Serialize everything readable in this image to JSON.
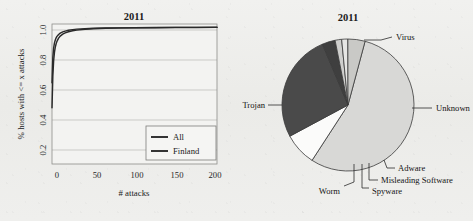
{
  "figure": {
    "background_color": "#eeeeec",
    "panels": [
      "line-chart",
      "pie-chart"
    ]
  },
  "chart_data": [
    {
      "type": "line",
      "title": "2011",
      "xlabel": "# attacks",
      "ylabel": "% hosts with <= x attacks",
      "xlim": [
        0,
        200
      ],
      "ylim": [
        0.15,
        1.02
      ],
      "xticks": [
        "0",
        "50",
        "100",
        "150",
        "200"
      ],
      "xtick_values": [
        0,
        50,
        100,
        150,
        200
      ],
      "yticks": [
        "0.2",
        "0.4",
        "0.6",
        "0.8",
        "1.0"
      ],
      "ytick_values": [
        0.2,
        0.4,
        0.6,
        0.8,
        1.0
      ],
      "grid": "horizontal",
      "legend_position": "lower right",
      "series": [
        {
          "name": "All",
          "color": "#2a2a2a",
          "x": [
            0,
            1,
            2,
            3,
            4,
            5,
            6,
            8,
            10,
            13,
            16,
            20,
            25,
            30,
            40,
            50,
            65,
            80,
            100,
            125,
            150,
            175,
            200
          ],
          "values": [
            0.5,
            0.695,
            0.793,
            0.845,
            0.876,
            0.897,
            0.912,
            0.932,
            0.945,
            0.957,
            0.965,
            0.972,
            0.978,
            0.982,
            0.987,
            0.99,
            0.993,
            0.995,
            0.996,
            0.997,
            0.998,
            0.998,
            0.999
          ]
        },
        {
          "name": "Finland",
          "color": "#2a2a2a",
          "x": [
            0,
            1,
            2,
            3,
            4,
            5,
            6,
            8,
            10,
            13,
            16,
            20,
            25,
            30,
            40,
            50,
            65,
            80,
            100,
            125,
            150,
            175,
            200
          ],
          "values": [
            0.655,
            0.812,
            0.872,
            0.903,
            0.921,
            0.934,
            0.943,
            0.955,
            0.963,
            0.971,
            0.976,
            0.981,
            0.985,
            0.988,
            0.991,
            0.993,
            0.995,
            0.996,
            0.997,
            0.998,
            0.999,
            0.999,
            1.0
          ]
        }
      ]
    },
    {
      "type": "pie",
      "title": "2011",
      "labels": [
        "Trojan",
        "Virus",
        "Unknown",
        "Adware",
        "Misleading Software",
        "Spyware",
        "Worm"
      ],
      "values": [
        55.0,
        8.0,
        26.5,
        3.2,
        1.6,
        1.5,
        4.2
      ],
      "colors": [
        "#d8d8d6",
        "#fbfbfa",
        "#4a4a4a",
        "#3f3f3f",
        "#cfcfcd",
        "#e6e6e4",
        "#c9c9c6"
      ],
      "start_angle_deg": -75,
      "direction": "clockwise",
      "label_placement": "outside-leader-lines"
    }
  ],
  "line_chart": {
    "title": "2011",
    "y_axis_label": "% hosts with <= x attacks",
    "x_axis_label": "# attacks",
    "y_ticks": [
      "1.0",
      "0.8",
      "0.6",
      "0.4",
      "0.2"
    ],
    "x_ticks": [
      "0",
      "50",
      "100",
      "150",
      "200"
    ],
    "legend": {
      "items": [
        {
          "label": "All",
          "color": "#2a2a2a"
        },
        {
          "label": "Finland",
          "color": "#2a2a2a"
        }
      ]
    }
  },
  "pie_chart": {
    "title": "2011",
    "labels": {
      "virus": "Virus",
      "unknown": "Unknown",
      "adware": "Adware",
      "misleading_software": "Misleading Software",
      "spyware": "Spyware",
      "worm": "Worm",
      "trojan": "Trojan"
    }
  }
}
